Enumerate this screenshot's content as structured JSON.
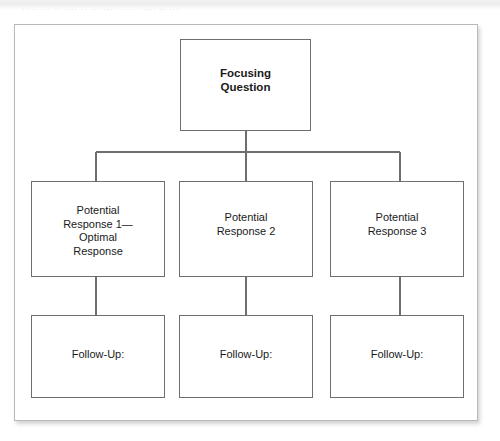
{
  "page": {
    "width": 500,
    "height": 441,
    "background_color": "#ffffff",
    "scan_artifact_text": "·· ·· ··· ·· ···· ·· ··· ···· ·· ··· ···· ·· ···"
  },
  "frame": {
    "border_color": "#b9b9b9",
    "fill_color": "#ffffff"
  },
  "diagram": {
    "type": "tree",
    "line_color": "#6e6e6e",
    "node_border_color": "#6e6e6e",
    "node_fill_color": "#ffffff",
    "text_color": "#1a1a1a",
    "root": {
      "label": "Focusing\nQuestion",
      "bold": true
    },
    "branches": [
      {
        "response_label": "Potential\nResponse 1—\nOptimal\nResponse",
        "follow_up_label": "Follow-Up:"
      },
      {
        "response_label": "Potential\nResponse 2",
        "follow_up_label": "Follow-Up:"
      },
      {
        "response_label": "Potential\nResponse 3",
        "follow_up_label": "Follow-Up:"
      }
    ]
  }
}
